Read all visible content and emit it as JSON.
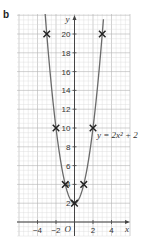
{
  "part_label": "b",
  "chart_data": {
    "type": "line",
    "title": "",
    "xlabel": "x",
    "ylabel": "y",
    "origin_label": "O",
    "xlim": [
      -6,
      6
    ],
    "ylim": [
      -1.4,
      22
    ],
    "x_ticks": [
      -4,
      -2,
      2,
      4
    ],
    "x_tick_labels": [
      "−4",
      "−2",
      "2",
      "4"
    ],
    "y_ticks": [
      2,
      4,
      6,
      8,
      10,
      12,
      14,
      16,
      18,
      20
    ],
    "y_tick_labels": [
      "2",
      "4",
      "6",
      "8",
      "10",
      "12",
      "14",
      "16",
      "18",
      "20"
    ],
    "grid": true,
    "series": [
      {
        "name": "y = 2x² + 2",
        "equation": "y = 2x² + 2",
        "curve": "parabola",
        "plotted_points": [
          {
            "x": -3,
            "y": 20
          },
          {
            "x": -2,
            "y": 10
          },
          {
            "x": -1,
            "y": 4
          },
          {
            "x": 0,
            "y": 2
          },
          {
            "x": 1,
            "y": 4
          },
          {
            "x": 2,
            "y": 10
          },
          {
            "x": 3,
            "y": 20
          }
        ],
        "marker": "cross",
        "color": "#555555"
      }
    ]
  },
  "colors": {
    "grid_minor": "#d8d8d8",
    "grid_major": "#b4b4b4",
    "axis": "#444444",
    "curve": "#6a6a6a",
    "marker": "#222222"
  }
}
